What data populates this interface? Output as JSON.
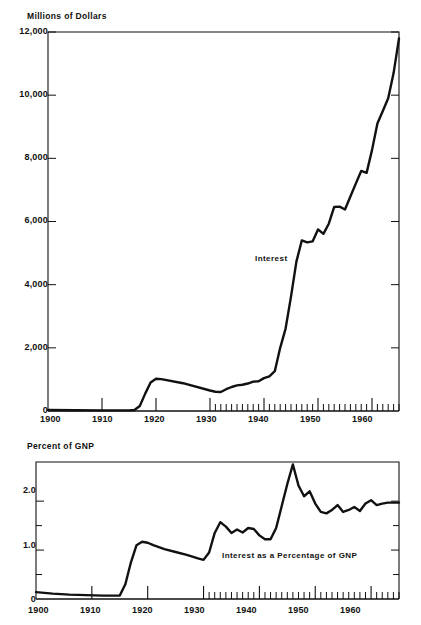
{
  "figure": {
    "cutoff_header": "Chart 5. Interest on the Public Debt",
    "background_color": "#ffffff",
    "line_color": "#111111"
  },
  "chart_data": [
    {
      "id": "interest-dollars",
      "type": "line",
      "title": "",
      "ylabel": "Millions of Dollars",
      "xlabel": "",
      "ylim": [
        0,
        12000
      ],
      "xlim": [
        1900,
        1965
      ],
      "grid": false,
      "legend": "none",
      "y_ticks": [
        0,
        2000,
        4000,
        6000,
        8000,
        10000,
        12000
      ],
      "y_tick_labels": [
        "0",
        "2,000",
        "4,000",
        "6,000",
        "8,000",
        "10,000",
        "12,000"
      ],
      "x_ticks": [
        1900,
        1910,
        1920,
        1930,
        1940,
        1950,
        1960
      ],
      "x_tick_labels": [
        "1900",
        "1910",
        "1920",
        "1930",
        "1940",
        "1950",
        "1960"
      ],
      "minor_x_ticks_from": 1930,
      "annotations": [
        {
          "text": "Interest",
          "x": 1944,
          "y": 4300
        }
      ],
      "series": [
        {
          "name": "Interest",
          "x": [
            1900,
            1905,
            1910,
            1915,
            1916,
            1917,
            1918,
            1919,
            1920,
            1921,
            1925,
            1930,
            1931,
            1932,
            1933,
            1934,
            1935,
            1936,
            1937,
            1938,
            1939,
            1940,
            1941,
            1942,
            1943,
            1944,
            1945,
            1946,
            1947,
            1948,
            1949,
            1950,
            1951,
            1952,
            1953,
            1954,
            1955,
            1956,
            1957,
            1958,
            1959,
            1960,
            1961,
            1962,
            1963,
            1964,
            1965
          ],
          "values": [
            30,
            25,
            20,
            20,
            30,
            160,
            550,
            900,
            1020,
            1010,
            880,
            650,
            610,
            600,
            690,
            760,
            810,
            830,
            870,
            930,
            940,
            1040,
            1100,
            1260,
            2000,
            2610,
            3620,
            4730,
            5400,
            5340,
            5370,
            5750,
            5610,
            5930,
            6460,
            6470,
            6380,
            6790,
            7200,
            7600,
            7540,
            8260,
            9100,
            9500,
            9900,
            10700,
            11800
          ]
        }
      ]
    },
    {
      "id": "interest-percent-gnp",
      "type": "line",
      "title": "",
      "ylabel": "Percent of GNP",
      "xlabel": "",
      "ylim": [
        0,
        2.8
      ],
      "xlim": [
        1900,
        1965
      ],
      "grid": false,
      "legend": "none",
      "y_ticks": [
        0,
        0.5,
        1.0,
        1.5,
        2.0
      ],
      "y_tick_labels": [
        "0",
        "",
        "1.0",
        "",
        "2.0"
      ],
      "x_ticks": [
        1900,
        1910,
        1920,
        1930,
        1940,
        1950,
        1960
      ],
      "x_tick_labels": [
        "1900",
        "1910",
        "1920",
        "1930",
        "1940",
        "1950",
        "1960"
      ],
      "minor_x_ticks_from": 1930,
      "annotations": [
        {
          "text": "Interest as a Percentage of GNP",
          "x": 1936,
          "y": 0.82
        }
      ],
      "series": [
        {
          "name": "Interest as a Percentage of GNP",
          "x": [
            1900,
            1903,
            1906,
            1909,
            1912,
            1915,
            1916,
            1917,
            1918,
            1919,
            1920,
            1921,
            1923,
            1925,
            1927,
            1929,
            1930,
            1931,
            1932,
            1933,
            1934,
            1935,
            1936,
            1937,
            1938,
            1939,
            1940,
            1941,
            1942,
            1943,
            1944,
            1945,
            1946,
            1947,
            1948,
            1949,
            1950,
            1951,
            1952,
            1953,
            1954,
            1955,
            1956,
            1957,
            1958,
            1959,
            1960,
            1961,
            1962,
            1963,
            1964,
            1965
          ],
          "values": [
            0.14,
            0.11,
            0.09,
            0.08,
            0.07,
            0.07,
            0.3,
            0.75,
            1.1,
            1.17,
            1.15,
            1.1,
            1.02,
            0.96,
            0.9,
            0.83,
            0.8,
            0.95,
            1.35,
            1.57,
            1.48,
            1.35,
            1.42,
            1.36,
            1.45,
            1.43,
            1.3,
            1.22,
            1.22,
            1.45,
            1.9,
            2.35,
            2.75,
            2.32,
            2.1,
            2.2,
            1.95,
            1.78,
            1.75,
            1.82,
            1.92,
            1.78,
            1.82,
            1.88,
            1.8,
            1.95,
            2.02,
            1.92,
            1.95,
            1.97,
            1.97,
            1.97
          ]
        }
      ]
    }
  ]
}
